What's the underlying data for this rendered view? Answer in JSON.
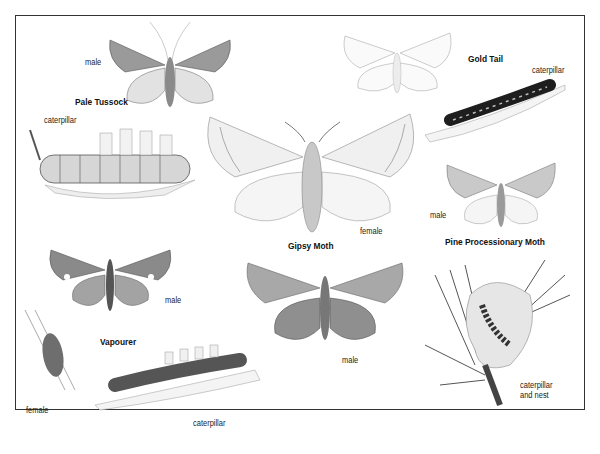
{
  "plate": {
    "species": [
      {
        "name": "Pale Tussock",
        "labels": {
          "male": "male",
          "caterpillar": "caterpillar"
        }
      },
      {
        "name": "Gold Tail",
        "labels": {
          "caterpillar": "caterpillar"
        }
      },
      {
        "name": "Gipsy Moth",
        "labels": {
          "female": "female",
          "male": "male"
        }
      },
      {
        "name": "Pine Processionary Moth",
        "labels": {
          "male": "male",
          "nest_line1": "caterpillar",
          "nest_line2": "and nest"
        }
      },
      {
        "name": "Vapourer",
        "labels": {
          "male": "male",
          "female": "female",
          "caterpillar": "caterpillar"
        }
      }
    ]
  },
  "colors": {
    "border": "#333333",
    "ink": "#222222",
    "wing_light": "#e8e8e8",
    "wing_mid": "#bdbdbd",
    "wing_dark": "#7a7a7a",
    "caterpillar_dark": "#1e1e1e"
  }
}
